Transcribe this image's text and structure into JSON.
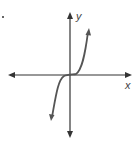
{
  "diagram": {
    "type": "function-graph",
    "axes": {
      "x_label": "x",
      "y_label": "y"
    },
    "colors": {
      "axis": "#333333",
      "curve": "#555555"
    }
  }
}
